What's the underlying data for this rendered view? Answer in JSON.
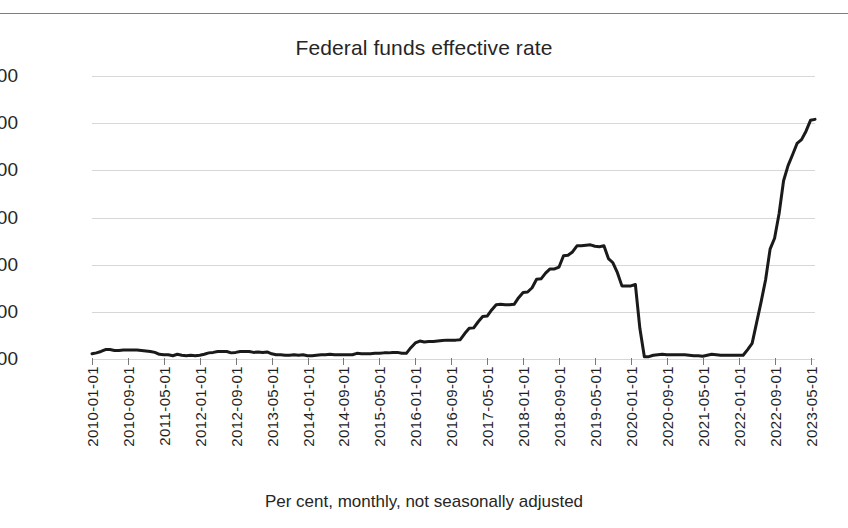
{
  "page": {
    "top_rule": "horizontal-rule"
  },
  "chart_data": {
    "type": "line",
    "title": "Federal funds effective rate",
    "subtitle": "",
    "xlabel": "",
    "ylabel": "",
    "caption": "Per cent, monthly, not seasonally adjusted",
    "ylim": [
      0.0,
      6.0
    ],
    "ytick_values": [
      0.0,
      1.0,
      2.0,
      3.0,
      4.0,
      5.0,
      6.0
    ],
    "ytick_labels": [
      "0.00",
      "1.00",
      "2.00",
      "3.00",
      "4.00",
      "5.00",
      "6.00"
    ],
    "grid": true,
    "legend": false,
    "legend_position": "none",
    "line_color": "#1a1a1a",
    "line_width": 3,
    "tick_labels": [
      "2010-01-01",
      "2010-09-01",
      "2011-05-01",
      "2012-01-01",
      "2012-09-01",
      "2013-05-01",
      "2014-01-01",
      "2014-09-01",
      "2015-05-01",
      "2016-01-01",
      "2016-09-01",
      "2017-05-01",
      "2018-01-01",
      "2018-09-01",
      "2019-05-01",
      "2020-01-01",
      "2020-09-01",
      "2021-05-01",
      "2022-01-01",
      "2022-09-01",
      "2023-05-01"
    ],
    "tick_interval_months": 8,
    "x_start": "2010-01-01",
    "x_end": "2023-06-01",
    "x": [
      "2010-01-01",
      "2010-02-01",
      "2010-03-01",
      "2010-04-01",
      "2010-05-01",
      "2010-06-01",
      "2010-07-01",
      "2010-08-01",
      "2010-09-01",
      "2010-10-01",
      "2010-11-01",
      "2010-12-01",
      "2011-01-01",
      "2011-02-01",
      "2011-03-01",
      "2011-04-01",
      "2011-05-01",
      "2011-06-01",
      "2011-07-01",
      "2011-08-01",
      "2011-09-01",
      "2011-10-01",
      "2011-11-01",
      "2011-12-01",
      "2012-01-01",
      "2012-02-01",
      "2012-03-01",
      "2012-04-01",
      "2012-05-01",
      "2012-06-01",
      "2012-07-01",
      "2012-08-01",
      "2012-09-01",
      "2012-10-01",
      "2012-11-01",
      "2012-12-01",
      "2013-01-01",
      "2013-02-01",
      "2013-03-01",
      "2013-04-01",
      "2013-05-01",
      "2013-06-01",
      "2013-07-01",
      "2013-08-01",
      "2013-09-01",
      "2013-10-01",
      "2013-11-01",
      "2013-12-01",
      "2014-01-01",
      "2014-02-01",
      "2014-03-01",
      "2014-04-01",
      "2014-05-01",
      "2014-06-01",
      "2014-07-01",
      "2014-08-01",
      "2014-09-01",
      "2014-10-01",
      "2014-11-01",
      "2014-12-01",
      "2015-01-01",
      "2015-02-01",
      "2015-03-01",
      "2015-04-01",
      "2015-05-01",
      "2015-06-01",
      "2015-07-01",
      "2015-08-01",
      "2015-09-01",
      "2015-10-01",
      "2015-11-01",
      "2015-12-01",
      "2016-01-01",
      "2016-02-01",
      "2016-03-01",
      "2016-04-01",
      "2016-05-01",
      "2016-06-01",
      "2016-07-01",
      "2016-08-01",
      "2016-09-01",
      "2016-10-01",
      "2016-11-01",
      "2016-12-01",
      "2017-01-01",
      "2017-02-01",
      "2017-03-01",
      "2017-04-01",
      "2017-05-01",
      "2017-06-01",
      "2017-07-01",
      "2017-08-01",
      "2017-09-01",
      "2017-10-01",
      "2017-11-01",
      "2017-12-01",
      "2018-01-01",
      "2018-02-01",
      "2018-03-01",
      "2018-04-01",
      "2018-05-01",
      "2018-06-01",
      "2018-07-01",
      "2018-08-01",
      "2018-09-01",
      "2018-10-01",
      "2018-11-01",
      "2018-12-01",
      "2019-01-01",
      "2019-02-01",
      "2019-03-01",
      "2019-04-01",
      "2019-05-01",
      "2019-06-01",
      "2019-07-01",
      "2019-08-01",
      "2019-09-01",
      "2019-10-01",
      "2019-11-01",
      "2019-12-01",
      "2020-01-01",
      "2020-02-01",
      "2020-03-01",
      "2020-04-01",
      "2020-05-01",
      "2020-06-01",
      "2020-07-01",
      "2020-08-01",
      "2020-09-01",
      "2020-10-01",
      "2020-11-01",
      "2020-12-01",
      "2021-01-01",
      "2021-02-01",
      "2021-03-01",
      "2021-04-01",
      "2021-05-01",
      "2021-06-01",
      "2021-07-01",
      "2021-08-01",
      "2021-09-01",
      "2021-10-01",
      "2021-11-01",
      "2021-12-01",
      "2022-01-01",
      "2022-02-01",
      "2022-03-01",
      "2022-04-01",
      "2022-05-01",
      "2022-06-01",
      "2022-07-01",
      "2022-08-01",
      "2022-09-01",
      "2022-10-01",
      "2022-11-01",
      "2022-12-01",
      "2023-01-01",
      "2023-02-01",
      "2023-03-01",
      "2023-04-01",
      "2023-05-01",
      "2023-06-01"
    ],
    "values": [
      0.11,
      0.13,
      0.16,
      0.2,
      0.2,
      0.18,
      0.18,
      0.19,
      0.19,
      0.19,
      0.19,
      0.18,
      0.17,
      0.16,
      0.14,
      0.1,
      0.09,
      0.09,
      0.07,
      0.1,
      0.08,
      0.07,
      0.08,
      0.07,
      0.08,
      0.1,
      0.13,
      0.14,
      0.16,
      0.16,
      0.16,
      0.13,
      0.14,
      0.16,
      0.16,
      0.16,
      0.14,
      0.15,
      0.14,
      0.15,
      0.11,
      0.09,
      0.09,
      0.08,
      0.08,
      0.09,
      0.08,
      0.09,
      0.07,
      0.07,
      0.08,
      0.09,
      0.09,
      0.1,
      0.09,
      0.09,
      0.09,
      0.09,
      0.09,
      0.12,
      0.11,
      0.11,
      0.11,
      0.12,
      0.12,
      0.13,
      0.13,
      0.14,
      0.14,
      0.12,
      0.12,
      0.24,
      0.34,
      0.38,
      0.36,
      0.37,
      0.37,
      0.38,
      0.39,
      0.4,
      0.4,
      0.4,
      0.41,
      0.54,
      0.65,
      0.66,
      0.79,
      0.9,
      0.91,
      1.04,
      1.15,
      1.16,
      1.15,
      1.15,
      1.16,
      1.3,
      1.41,
      1.42,
      1.51,
      1.69,
      1.7,
      1.82,
      1.91,
      1.91,
      1.95,
      2.19,
      2.2,
      2.27,
      2.4,
      2.4,
      2.41,
      2.42,
      2.39,
      2.38,
      2.4,
      2.13,
      2.04,
      1.83,
      1.55,
      1.55,
      1.55,
      1.58,
      0.65,
      0.05,
      0.05,
      0.08,
      0.09,
      0.1,
      0.09,
      0.09,
      0.09,
      0.09,
      0.09,
      0.08,
      0.07,
      0.07,
      0.06,
      0.08,
      0.1,
      0.09,
      0.08,
      0.08,
      0.08,
      0.08,
      0.08,
      0.08,
      0.2,
      0.33,
      0.77,
      1.21,
      1.68,
      2.33,
      2.56,
      3.08,
      3.78,
      4.1,
      4.33,
      4.57,
      4.65,
      4.83,
      5.06,
      5.08
    ],
    "annotations": [
      {
        "label": "near-zero lower bound",
        "period": "2010-01 to 2015-11",
        "approx_value": 0.12
      },
      {
        "label": "tightening cycle peak",
        "period": "2019-01 to 2019-07",
        "approx_value": 2.4
      },
      {
        "label": "COVID-19 rate cut",
        "period": "2020-03 to 2020-04",
        "approx_value": 0.05
      },
      {
        "label": "2022-2023 tightening",
        "period": "2022-03 to 2023-06",
        "approx_value": 5.08
      }
    ]
  }
}
